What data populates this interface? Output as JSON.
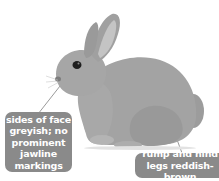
{
  "header": {
    "title_fragment": ""
  },
  "illustration": {
    "subject": "rabbit",
    "colors": {
      "body": "#a3a3a3",
      "body_dark": "#7d7d7d",
      "ear_inner": "#c4c4c4",
      "eye": "#1e1e1e",
      "label_bg": "#8a8a8a",
      "label_text": "#ffffff",
      "leader_line": "#9a9a9a"
    }
  },
  "annotations": [
    {
      "id": "face",
      "text": "sides of face greyish; no prominent jawline markings"
    },
    {
      "id": "rump",
      "text": "rump and hind legs reddish-brown"
    }
  ]
}
